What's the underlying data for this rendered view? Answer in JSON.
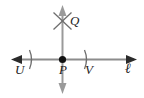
{
  "figure": {
    "kind": "geometry-diagram",
    "stroke_color": "#8c8c8c",
    "label_color": "#1c1c1c",
    "background_color": "#ffffff",
    "point_color": "#111111"
  },
  "labels": {
    "U": "U",
    "P": "P",
    "V": "V",
    "Q": "Q",
    "line": "ℓ"
  },
  "elements": {
    "horizontal_line": {
      "name": "line-l",
      "y": 59,
      "x_start": 12,
      "x_end": 136,
      "arrow_left": true,
      "arrow_right": true
    },
    "vertical_line": {
      "name": "perpendicular-line",
      "x": 62,
      "y_start": 6,
      "y_end": 93,
      "arrow_top": true,
      "arrow_bottom": true
    },
    "point_P": {
      "x": 62,
      "y": 59,
      "filled": true
    },
    "tick_U": {
      "x": 31,
      "y": 59
    },
    "tick_V": {
      "x": 86,
      "y": 59
    },
    "arc_cross_Q": {
      "x": 62,
      "y": 21
    }
  }
}
